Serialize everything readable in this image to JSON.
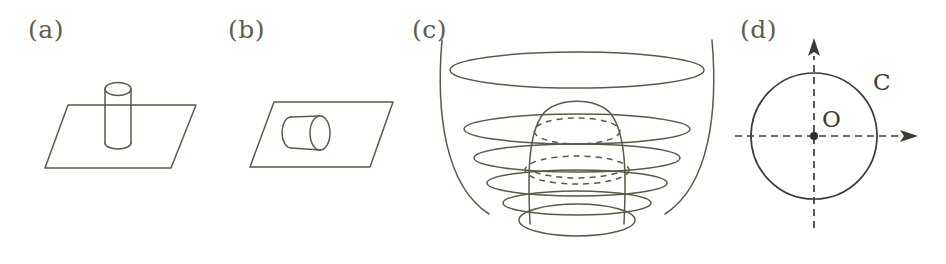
{
  "figure": {
    "caption_color": "#5d5d50",
    "stroke_color": "#5a5a46",
    "axis_color": "#3b3b32",
    "background_color": "#ffffff",
    "width": 946,
    "height": 264
  },
  "panels": [
    {
      "id": "a",
      "label": "(a)",
      "description": "cylinder standing vertically through a plane",
      "label_x": 28,
      "label_y": 38
    },
    {
      "id": "b",
      "label": "(b)",
      "description": "cylinder lying horizontally on a plane",
      "label_x": 228,
      "label_y": 38
    },
    {
      "id": "c",
      "label": "(c)",
      "description": "bell-shaped surface inside a bowl with level rings",
      "label_x": 412,
      "label_y": 38
    },
    {
      "id": "d",
      "label": "(d)",
      "description": "circle C centred at origin O with dashed coordinate axes",
      "label_x": 740,
      "label_y": 38
    }
  ],
  "labels": {
    "origin": "O",
    "curve": "C"
  },
  "label_positions": {
    "origin_x": 822,
    "origin_y": 127,
    "curve_x": 873,
    "curve_y": 90
  }
}
